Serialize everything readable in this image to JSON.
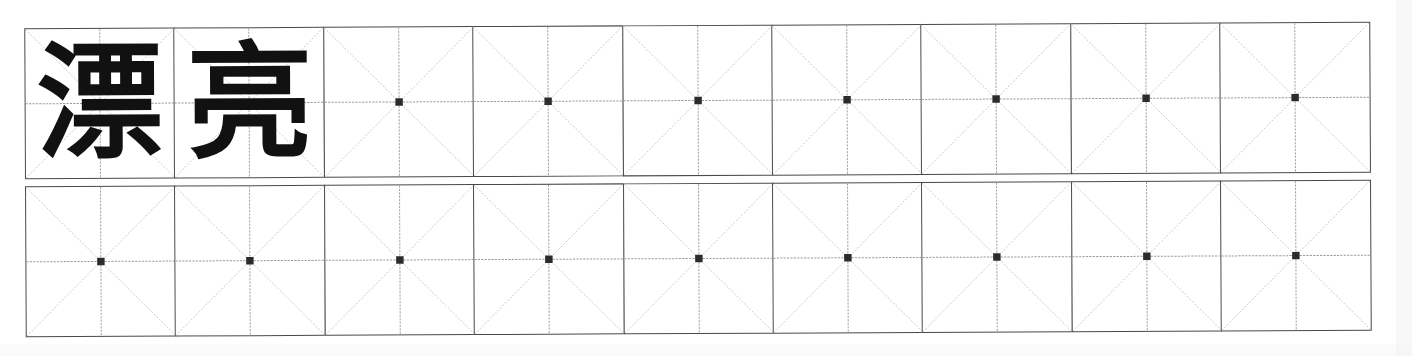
{
  "worksheet": {
    "title": "Chinese character handwriting practice sheet",
    "grid_type": "mi-zi-ge",
    "columns": 9,
    "rows": 2,
    "cell_size_px": 151,
    "colors": {
      "cell_border": "#4a4a4a",
      "center_line": "#9a9a9a",
      "diagonal_line": "#c4c4c4",
      "center_dot": "#2b2b2b",
      "glyph": "#111111",
      "paper": "#ffffff"
    },
    "rows_data": [
      {
        "row_label": "row-1",
        "cells": [
          {
            "index": 1,
            "character": "漂",
            "filled": true
          },
          {
            "index": 2,
            "character": "亮",
            "filled": true
          },
          {
            "index": 3,
            "character": "",
            "filled": false
          },
          {
            "index": 4,
            "character": "",
            "filled": false
          },
          {
            "index": 5,
            "character": "",
            "filled": false
          },
          {
            "index": 6,
            "character": "",
            "filled": false
          },
          {
            "index": 7,
            "character": "",
            "filled": false
          },
          {
            "index": 8,
            "character": "",
            "filled": false
          },
          {
            "index": 9,
            "character": "",
            "filled": false
          }
        ]
      },
      {
        "row_label": "row-2",
        "cells": [
          {
            "index": 1,
            "character": "",
            "filled": false
          },
          {
            "index": 2,
            "character": "",
            "filled": false
          },
          {
            "index": 3,
            "character": "",
            "filled": false
          },
          {
            "index": 4,
            "character": "",
            "filled": false
          },
          {
            "index": 5,
            "character": "",
            "filled": false
          },
          {
            "index": 6,
            "character": "",
            "filled": false
          },
          {
            "index": 7,
            "character": "",
            "filled": false
          },
          {
            "index": 8,
            "character": "",
            "filled": false
          },
          {
            "index": 9,
            "character": "",
            "filled": false
          }
        ]
      }
    ],
    "word": "漂亮"
  }
}
